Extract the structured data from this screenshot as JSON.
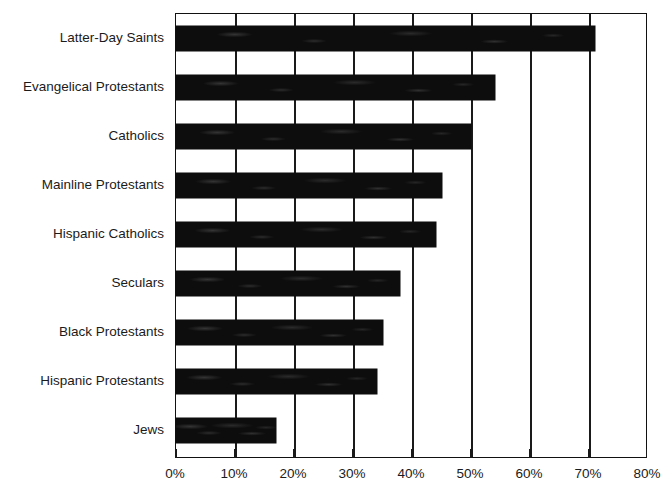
{
  "chart_data": {
    "type": "bar",
    "orientation": "horizontal",
    "title": "",
    "subtitle": "",
    "xlabel": "",
    "ylabel": "",
    "xlim": [
      0,
      80
    ],
    "ylim": null,
    "grid": true,
    "legend": false,
    "legend_position": "none",
    "bar_color": "#0d0d0d",
    "axis_color": "#1a1a1a",
    "background_color": "#ffffff",
    "xticks": [
      0,
      10,
      20,
      30,
      40,
      50,
      60,
      70,
      80
    ],
    "xtick_labels": [
      "0%",
      "10%",
      "20%",
      "30%",
      "40%",
      "50%",
      "60%",
      "70%",
      "80%"
    ],
    "categories": [
      "Latter-Day Saints",
      "Evangelical Protestants",
      "Catholics",
      "Mainline Protestants",
      "Hispanic Catholics",
      "Seculars",
      "Black Protestants",
      "Hispanic Protestants",
      "Jews"
    ],
    "values": [
      71,
      54,
      50,
      45,
      44,
      38,
      35,
      34,
      17
    ],
    "value_labels": [
      "71%",
      "54%",
      "50%",
      "45%",
      "44%",
      "38%",
      "35%",
      "34%",
      "17%"
    ],
    "series": [
      {
        "name": "Percent",
        "values": [
          71,
          54,
          50,
          45,
          44,
          38,
          35,
          34,
          17
        ]
      }
    ],
    "annotations": []
  }
}
